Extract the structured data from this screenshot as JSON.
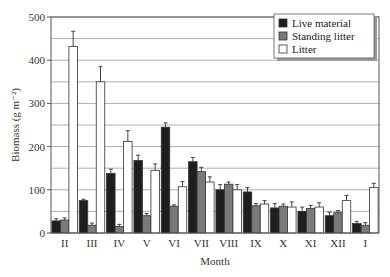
{
  "chart_data": {
    "type": "bar",
    "title": "",
    "xlabel": "Month",
    "ylabel": "Biomass (g m⁻²)",
    "ylim": [
      0,
      500
    ],
    "yticks": [
      0,
      100,
      200,
      300,
      400,
      500
    ],
    "grid": true,
    "grid_step": 50,
    "legend_position": "top-right",
    "categories": [
      "II",
      "III",
      "IV",
      "V",
      "VI",
      "VII",
      "VIII",
      "IX",
      "X",
      "XI",
      "XII",
      "I"
    ],
    "series": [
      {
        "name": "Live material",
        "color": "#1e1e1e",
        "values": [
          28,
          75,
          138,
          168,
          245,
          165,
          100,
          95,
          58,
          50,
          40,
          22
        ],
        "errors": [
          5,
          3,
          10,
          12,
          10,
          10,
          12,
          10,
          10,
          10,
          8,
          5
        ]
      },
      {
        "name": "Standing litter",
        "color": "#7a7a7a",
        "values": [
          30,
          18,
          15,
          40,
          62,
          142,
          113,
          63,
          62,
          57,
          47,
          18
        ],
        "errors": [
          5,
          5,
          5,
          5,
          3,
          10,
          5,
          5,
          5,
          7,
          5,
          6
        ]
      },
      {
        "name": "Litter",
        "color": "#ffffff",
        "values": [
          432,
          350,
          212,
          145,
          107,
          118,
          100,
          67,
          60,
          60,
          75,
          105
        ],
        "errors": [
          35,
          35,
          25,
          15,
          12,
          12,
          12,
          8,
          12,
          10,
          12,
          10
        ]
      }
    ]
  }
}
